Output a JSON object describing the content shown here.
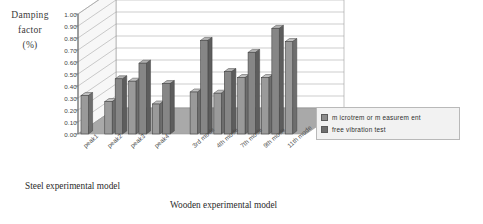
{
  "axis_title": {
    "line1": "Damping",
    "line2": "factor",
    "line3": "(%)"
  },
  "captions": {
    "steel": "Steel experimental model",
    "wooden": "Wooden experimental model"
  },
  "legend": {
    "items": [
      {
        "label": "m icrotrem or m easurem ent",
        "color": "#8c8c8c"
      },
      {
        "label": "free vibration test",
        "color": "#6f6f6f"
      }
    ]
  },
  "colors": {
    "series1": "#9a9a9a",
    "series1_side": "#6e6e6e",
    "series1_top": "#c2c2c2",
    "series2": "#868686",
    "series2_side": "#5d5d5d",
    "series2_top": "#b2b2b2",
    "wall_back": "#ffffff",
    "wall_side": "#f7f7f7",
    "floor": "#a9a9a9",
    "grid": "#9b9b9b",
    "axis": "#6a6a6a"
  },
  "chart_data": {
    "type": "bar",
    "title": "",
    "xlabel": "",
    "ylabel": "Damping factor (%)",
    "ylim": [
      0.0,
      1.0
    ],
    "yticks": [
      "0.00",
      "0.10",
      "0.20",
      "0.30",
      "0.40",
      "0.50",
      "0.60",
      "0.70",
      "0.80",
      "0.90",
      "1.00"
    ],
    "grid": true,
    "legend_position": "right",
    "categories": [
      "peak1",
      "peak2",
      "peak3",
      "peak4",
      "3rd mode",
      "4th mode",
      "7th mode",
      "9th mode",
      "11th mode"
    ],
    "series": [
      {
        "name": "m icrotrem or m easurem ent",
        "values": [
          0.32,
          0.27,
          0.44,
          0.25,
          0.35,
          0.34,
          0.47,
          0.47,
          0.77
        ]
      },
      {
        "name": "free vibration test",
        "values": [
          null,
          0.46,
          0.59,
          0.42,
          0.78,
          0.52,
          0.68,
          0.88,
          null
        ]
      }
    ],
    "groups": [
      {
        "name": "Steel experimental model",
        "categories": [
          "peak1",
          "peak2",
          "peak3",
          "peak4"
        ]
      },
      {
        "name": "Wooden experimental model",
        "categories": [
          "3rd mode",
          "4th mode",
          "7th mode",
          "9th mode",
          "11th mode"
        ]
      }
    ]
  }
}
